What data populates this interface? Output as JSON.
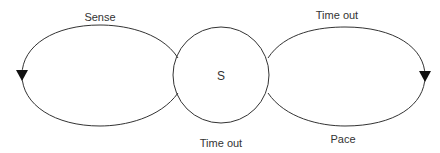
{
  "diagram": {
    "state": {
      "label": "S"
    },
    "loops": [
      {
        "id": "left-loop",
        "top_label": "Sense"
      },
      {
        "id": "right-loop",
        "top_label": "Time out",
        "bottom_label": "Pace"
      }
    ],
    "bottom_center_label": "Time out",
    "colors": {
      "stroke": "#333333",
      "arrow": "#111111",
      "background": "#ffffff"
    }
  }
}
